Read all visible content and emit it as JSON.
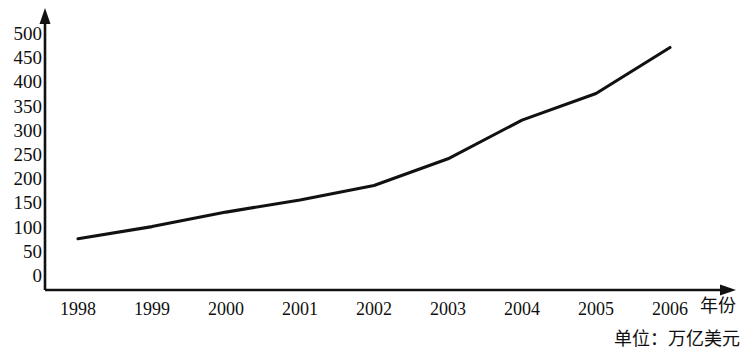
{
  "chart_data": {
    "type": "line",
    "title": "",
    "subtitle": "",
    "xlabel": "年份",
    "ylabel": "",
    "unit_note": "单位：万亿美元",
    "categories": [
      "1998",
      "1999",
      "2000",
      "2001",
      "2002",
      "2003",
      "2004",
      "2005",
      "2006"
    ],
    "x": [
      1998,
      1999,
      2000,
      2001,
      2002,
      2003,
      2004,
      2005,
      2006
    ],
    "values": [
      75,
      100,
      130,
      155,
      185,
      240,
      320,
      375,
      470
    ],
    "series": [
      {
        "name": "",
        "values": [
          75,
          100,
          130,
          155,
          185,
          240,
          320,
          375,
          470
        ]
      }
    ],
    "ylim": [
      0,
      500
    ],
    "yticks": [
      0,
      50,
      100,
      150,
      200,
      250,
      300,
      350,
      400,
      450,
      500
    ],
    "ytick_labels": [
      "0",
      "50",
      "100",
      "150",
      "200",
      "250",
      "300",
      "350",
      "400",
      "450",
      "500"
    ],
    "xtick_labels": [
      "1998",
      "1999",
      "2000",
      "2001",
      "2002",
      "2003",
      "2004",
      "2005",
      "2006"
    ],
    "grid": false,
    "legend": "none",
    "line_color": "#111111",
    "axis_color": "#111111",
    "background_color": "#ffffff"
  }
}
